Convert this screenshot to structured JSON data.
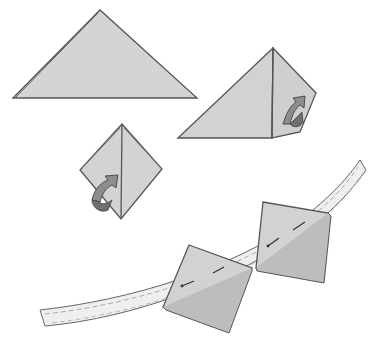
{
  "figure": {
    "title": "Folding triangle pockets and attaching to ribbon band",
    "steps": [
      {
        "id": "step-1",
        "description": "Flat triangle folded in half"
      },
      {
        "id": "step-2",
        "description": "Fold right corner in (arrow)"
      },
      {
        "id": "step-3",
        "description": "Fold left corner in to form square pocket (arrow)"
      },
      {
        "id": "step-4",
        "description": "Pin squares onto curved band"
      }
    ],
    "colors": {
      "paper": "#d2d2d2",
      "paper_shade": "#bdbdbd",
      "outline": "#555555",
      "arrow": "#8a8a8a",
      "band": "#ececec",
      "background": "#ffffff"
    }
  }
}
